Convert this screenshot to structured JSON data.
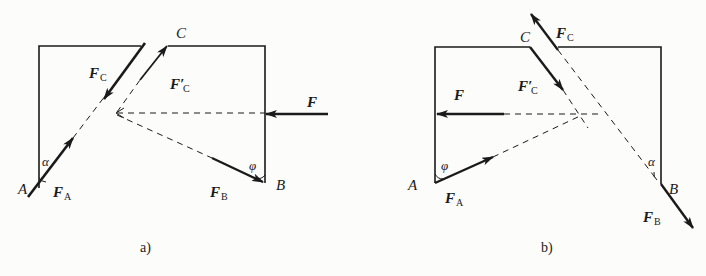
{
  "figure_a": {
    "caption": "a)",
    "points": {
      "A": "A",
      "B": "B",
      "C": "C"
    },
    "forces": {
      "FA": "F",
      "FA_sub": "A",
      "FB": "F",
      "FB_sub": "B",
      "FC": "F",
      "FC_sub": "C",
      "FCp": "F′",
      "FCp_sub": "C",
      "F": "F"
    },
    "angles": {
      "alpha": "α",
      "phi": "φ"
    }
  },
  "figure_b": {
    "caption": "b)",
    "points": {
      "A": "A",
      "B": "B",
      "C": "C"
    },
    "forces": {
      "FA": "F",
      "FA_sub": "A",
      "FB": "F",
      "FB_sub": "B",
      "FC": "F",
      "FC_sub": "C",
      "FCp": "F′",
      "FCp_sub": "C",
      "F": "F"
    },
    "angles": {
      "alpha": "α",
      "phi": "φ"
    }
  },
  "colors": {
    "line": "#1a1a1a",
    "background": "#fcfcfb"
  }
}
